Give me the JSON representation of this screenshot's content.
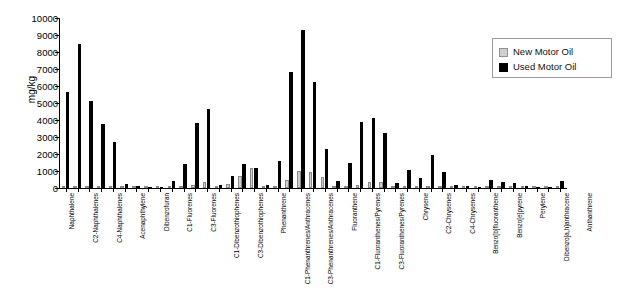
{
  "chart_data": {
    "type": "bar",
    "title": "",
    "xlabel": "",
    "ylabel": "mg/kg",
    "ylim": [
      0,
      10000
    ],
    "ytick_step": 1000,
    "yticks": [
      "10000",
      "9000",
      "8000",
      "7000",
      "6000",
      "5000",
      "4000",
      "3000",
      "2000",
      "1000",
      "0"
    ],
    "grid": false,
    "legend_position": "top-right",
    "colors": {
      "new_motor_oil": "#cfcfcf",
      "used_motor_oil": "#000000"
    },
    "categories": [
      "Naphthalene",
      "C1-Naphthalenes",
      "C2-Naphthalenes",
      "C3-Naphthalenes",
      "C4-Naphthalenes",
      "Biphenyl",
      "Acenaphthylene",
      "Acenaphthene",
      "Dibenzofuran",
      "Fluorene",
      "C1-Fluorenes",
      "C2-Fluorenes",
      "C3-Fluorenes",
      "Dibenzothiophene",
      "C1-Dibenzothiophenes",
      "C2-Dibenzothiophenes",
      "C3-Dibenzothiophenes",
      "Anthracene",
      "Phenanthrene",
      "C1-Phenanthrenes/Anthracenes",
      "C2-Phenanthrenes/Anthracenes",
      "C3-Phenanthrenes/Anthracenes",
      "C4-Phenanthrenes/Anthracenes",
      "Fluoranthene",
      "Pyrene",
      "C1-Fluoranthenes/Pyrenes",
      "C2-Fluoranthenes/Pyrenes",
      "C3-Fluoranthenes/Pyrenes",
      "Benzo[a]anthracene",
      "Chrysene",
      "C1-Chrysenes",
      "C2-Chrysenes",
      "C3-Chrysenes",
      "C4-Chrysenes",
      "Benzo[b]fluoranthene",
      "Benzo[k]fluoranthene",
      "Benzo[e]pyrene",
      "Benzo[a]pyrene",
      "Perylene",
      "Indeno[1,2,3-cd]pyrene",
      "Dibenzo[a,h]anthracene",
      "Benzo[g,h,i]perylene",
      "Anthanthrene"
    ],
    "tick_labels": [
      "Naphthalene",
      "",
      "C2-Naphthalenes",
      "",
      "C4-Naphthalenes",
      "",
      "Acenaphthylene",
      "",
      "Dibenzofuran",
      "",
      "C1-Fluorenes",
      "",
      "C3-Fluorenes",
      "",
      "C1-Dibenzothiophenes",
      "",
      "C3-Dibenzothiophenes",
      "",
      "Phenanthrene",
      "",
      "C1-Phenanthrenes/Anthracenes",
      "",
      "C3-Phenanthrenes/Anthracenes",
      "",
      "Fluoranthene",
      "",
      "C1-Fluoranthenes/Pyrenes",
      "",
      "C3-Fluoranthenes/Pyrenes",
      "",
      "Chrysene",
      "",
      "C2-Chrysenes",
      "",
      "C4-Chrysenes",
      "",
      "Benzo[b]fluoranthene",
      "",
      "Benzo[e]pyrene",
      "",
      "Perylene",
      "",
      "Dibenzo[a,h]anthracene",
      "",
      "Anthanthrene"
    ],
    "series": [
      {
        "name": "New Motor Oil",
        "values": [
          10,
          15,
          25,
          60,
          140,
          20,
          5,
          8,
          10,
          20,
          60,
          180,
          380,
          30,
          210,
          700,
          1150,
          15,
          90,
          480,
          980,
          940,
          620,
          25,
          30,
          200,
          340,
          330,
          20,
          30,
          60,
          70,
          60,
          40,
          10,
          8,
          20,
          10,
          15,
          8,
          5,
          10,
          8
        ]
      },
      {
        "name": "Used Motor Oil",
        "values": [
          5620,
          8480,
          5140,
          3760,
          2730,
          260,
          90,
          60,
          70,
          410,
          1420,
          3820,
          4650,
          180,
          720,
          1390,
          1180,
          150,
          1600,
          6800,
          9300,
          6220,
          2270,
          440,
          1470,
          3880,
          4130,
          3260,
          310,
          1040,
          600,
          1940,
          930,
          150,
          120,
          70,
          500,
          360,
          300,
          90,
          60,
          80,
          430
        ]
      }
    ]
  },
  "legend": {
    "items": [
      {
        "label": "New Motor Oil",
        "swatch": "light-gray-square"
      },
      {
        "label": "Used Motor Oil",
        "swatch": "black-square"
      }
    ]
  }
}
